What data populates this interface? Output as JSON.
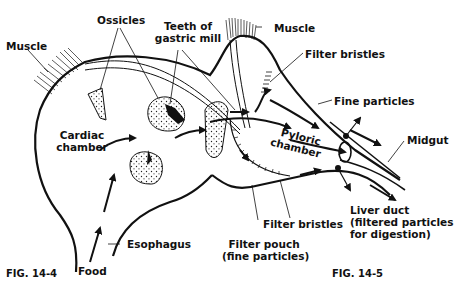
{
  "labels": {
    "muscle_left": "Muscle",
    "ossicles": "Ossicles",
    "teeth_line1": "Teeth of",
    "teeth_line2": "gastric mill",
    "muscle_right": "Muscle",
    "filter_bristles_top": "Filter bristles",
    "fine_particles": "Fine particles",
    "cardiac_line1": "Cardiac",
    "cardiac_line2": "chamber",
    "pyloric_line1": "Pyloric",
    "pyloric_line2": "chamber",
    "midgut": "Midgut",
    "liver_line1": "Liver duct",
    "liver_line2": "(filtered particles",
    "liver_line3": "for digestion)",
    "filter_bristles_bottom": "Filter bristles",
    "filter_pouch_line1": "Filter pouch",
    "filter_pouch_line2": "(fine particles)",
    "esophagus": "Esophagus",
    "food": "Food"
  },
  "figures": {
    "left": "FIG. 14-4",
    "right": "FIG. 14-5"
  },
  "colors": {
    "ink": "#111111",
    "background": "#ffffff"
  }
}
